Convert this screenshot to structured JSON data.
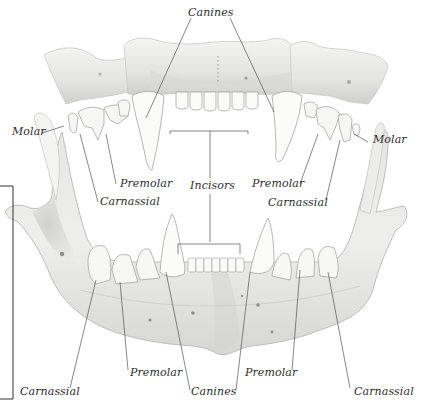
{
  "diagram": {
    "colors": {
      "bone_light": "#f1f1ef",
      "bone_mid": "#dcdcda",
      "bone_shadow": "#bdbdbb",
      "tooth": "#fbfbfa",
      "line": "#555555",
      "text": "#2e2e2e"
    },
    "labels": {
      "canines_top": "Canines",
      "molar_left": "Molar",
      "molar_right": "Molar",
      "premolar_upper_left": "Premolar",
      "premolar_upper_right": "Premolar",
      "carnassial_upper_left": "Carnassial",
      "carnassial_upper_right": "Carnassial",
      "incisors": "Incisors",
      "carnassial_lower_left": "Carnassial",
      "premolar_lower_left": "Premolar",
      "canines_bottom": "Canines",
      "premolar_lower_right": "Premolar",
      "carnassial_lower_right": "Carnassial"
    }
  }
}
